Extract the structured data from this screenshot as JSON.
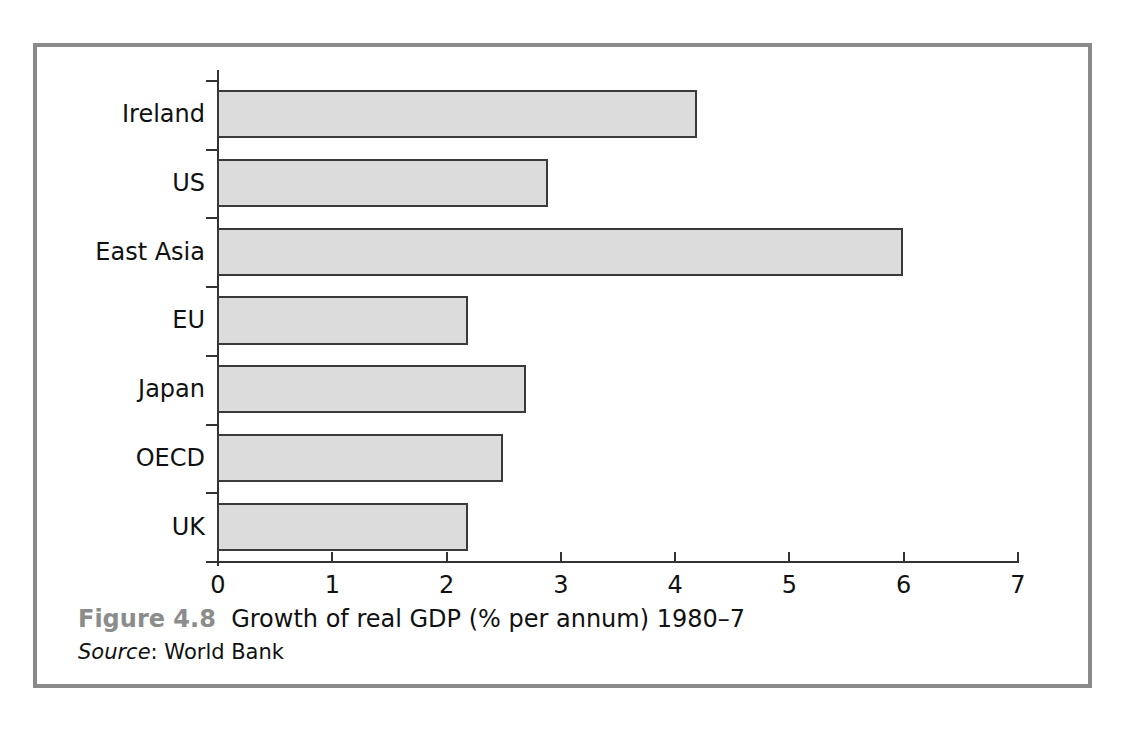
{
  "figure": {
    "number_label": "Figure 4.8",
    "caption_title": "Growth of real GDP (% per annum) 1980–7",
    "source_label": "Source",
    "source_separator": ": ",
    "source_value": "World Bank",
    "frame_color": "#8a8a8a"
  },
  "chart_data": {
    "type": "bar",
    "orientation": "horizontal",
    "title": "Growth of real GDP (% per annum) 1980–7",
    "subtitle": "",
    "xlabel": "",
    "ylabel": "",
    "categories": [
      "Ireland",
      "US",
      "East Asia",
      "EU",
      "Japan",
      "OECD",
      "UK"
    ],
    "values": [
      4.2,
      2.9,
      6.0,
      2.2,
      2.7,
      2.5,
      2.2
    ],
    "series": [
      {
        "name": "Growth of real GDP (% per annum) 1980-7",
        "values": [
          4.2,
          2.9,
          6.0,
          2.2,
          2.7,
          2.5,
          2.2
        ]
      }
    ],
    "xlim": [
      0,
      7
    ],
    "x_ticks": [
      0,
      1,
      2,
      3,
      4,
      5,
      6,
      7
    ],
    "x_tick_labels": [
      "0",
      "1",
      "2",
      "3",
      "4",
      "5",
      "6",
      "7"
    ],
    "grid": false,
    "legend": false,
    "legend_position": "none",
    "bar_fill_color": "#dcdcdc",
    "bar_border_color": "#3a3a3a",
    "axis_color": "#333333",
    "source": "World Bank"
  }
}
